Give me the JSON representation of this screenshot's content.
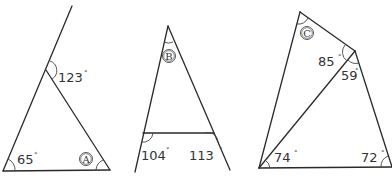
{
  "figures": [
    {
      "id": "A",
      "unknown_label": "A",
      "angles": [
        {
          "value": "65",
          "unit": "°",
          "position": "bottom-left interior"
        },
        {
          "value": "123",
          "unit": "°",
          "position": "exterior at apex"
        }
      ]
    },
    {
      "id": "B",
      "unknown_label": "B",
      "angles": [
        {
          "value": "104",
          "unit": "°",
          "position": "exterior bottom-left"
        },
        {
          "value": "113",
          "unit": "°",
          "position": "exterior bottom-right"
        }
      ]
    },
    {
      "id": "C",
      "unknown_label": "C",
      "angles": [
        {
          "value": "85",
          "unit": "°",
          "position": "right vertex, upper"
        },
        {
          "value": "59",
          "unit": "°",
          "position": "right vertex, lower"
        },
        {
          "value": "74",
          "unit": "°",
          "position": "bottom-left"
        },
        {
          "value": "72",
          "unit": "°",
          "position": "bottom-right"
        }
      ]
    }
  ]
}
